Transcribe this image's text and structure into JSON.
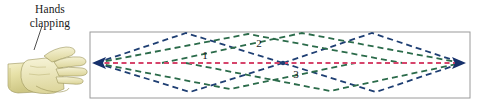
{
  "figure": {
    "caption": {
      "line1": "Hands",
      "line2": "clapping"
    },
    "source_icon": "clapping-hands-illustration",
    "leader_line": "caption-leader-line"
  },
  "colors": {
    "direct_path": "#d6446b",
    "reflected_path_blue": "#1f3f73",
    "reflected_path_green": "#2b6b4a",
    "arrowhead": "#16306b",
    "box_border": "#9a9a9a",
    "background": "#ffffff",
    "skin_light": "#f2eec2",
    "skin_mid": "#ddd89a",
    "skin_shade": "#c6c077",
    "outline": "#8f8a4e",
    "text": "#1a1a1a"
  },
  "diagram": {
    "box": {
      "x": 90,
      "y": 32,
      "width": 380,
      "height": 66
    },
    "source_point": {
      "x": 96,
      "y": 63,
      "name": "left-arrowhead-source"
    },
    "mid_point": {
      "x": 283,
      "y": 63,
      "name": "center-focus-point"
    },
    "receiver_point": {
      "x": 462,
      "y": 63,
      "name": "right-arrowhead-receiver"
    },
    "labels": [
      {
        "id": "1",
        "text": "1",
        "x": 205,
        "y": 59,
        "describes": "direct-path"
      },
      {
        "id": "2",
        "text": "2",
        "x": 259,
        "y": 46,
        "describes": "upper-reflected-path"
      },
      {
        "id": "3",
        "text": "3",
        "x": 296,
        "y": 77,
        "describes": "lower-reflected-path"
      }
    ],
    "paths": {
      "direct": {
        "name": "direct-sound-path",
        "color": "#d6446b",
        "dash": "5 3.5",
        "width": 1.7,
        "points": "96,63 462,63"
      },
      "blue_upper_left": {
        "name": "blue-upper-left-path",
        "points": "96,63 186,33 283,63"
      },
      "blue_lower_left": {
        "name": "blue-lower-left-path",
        "points": "96,63 190,92 283,63"
      },
      "blue_upper_right": {
        "name": "blue-upper-right-path",
        "points": "283,63 372,33 462,63"
      },
      "blue_lower_right": {
        "name": "blue-lower-right-path",
        "points": "283,63 376,92 462,63"
      },
      "green_upper": {
        "name": "green-upper-path",
        "points": "96,63 248,34 402,63"
      },
      "green_lower": {
        "name": "green-lower-path",
        "points": "96,63 230,89 355,63"
      },
      "green_upper_right": {
        "name": "green-upper-right-path",
        "points": "162,63 302,33 462,63"
      },
      "green_lower_right": {
        "name": "green-lower-right-path",
        "points": "186,63 330,91 462,63"
      }
    }
  }
}
